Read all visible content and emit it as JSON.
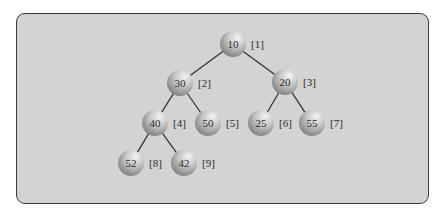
{
  "diagram": {
    "type": "binary-heap-tree",
    "colors": {
      "panel_bg": "#d3d3d1",
      "panel_border": "#3a3a3a",
      "edge": "#2f2f2f",
      "node_light": "#f2f2f0",
      "node_dark": "#8a8a88",
      "text": "#2a2a2a"
    },
    "nodes": [
      {
        "id": 1,
        "value": "10",
        "index": "[1]",
        "x": 233,
        "y": 44
      },
      {
        "id": 2,
        "value": "30",
        "index": "[2]",
        "x": 180,
        "y": 83
      },
      {
        "id": 3,
        "value": "20",
        "index": "[3]",
        "x": 285,
        "y": 82
      },
      {
        "id": 4,
        "value": "40",
        "index": "[4]",
        "x": 155,
        "y": 123
      },
      {
        "id": 5,
        "value": "50",
        "index": "[5]",
        "x": 208,
        "y": 123
      },
      {
        "id": 6,
        "value": "25",
        "index": "[6]",
        "x": 261,
        "y": 123
      },
      {
        "id": 7,
        "value": "55",
        "index": "[7]",
        "x": 312,
        "y": 123
      },
      {
        "id": 8,
        "value": "52",
        "index": "[8]",
        "x": 131,
        "y": 163
      },
      {
        "id": 9,
        "value": "42",
        "index": "[9]",
        "x": 184,
        "y": 163
      }
    ],
    "edges": [
      {
        "from": 1,
        "to": 2
      },
      {
        "from": 1,
        "to": 3
      },
      {
        "from": 2,
        "to": 4
      },
      {
        "from": 2,
        "to": 5
      },
      {
        "from": 3,
        "to": 6
      },
      {
        "from": 3,
        "to": 7
      },
      {
        "from": 4,
        "to": 8
      },
      {
        "from": 4,
        "to": 9
      }
    ]
  }
}
